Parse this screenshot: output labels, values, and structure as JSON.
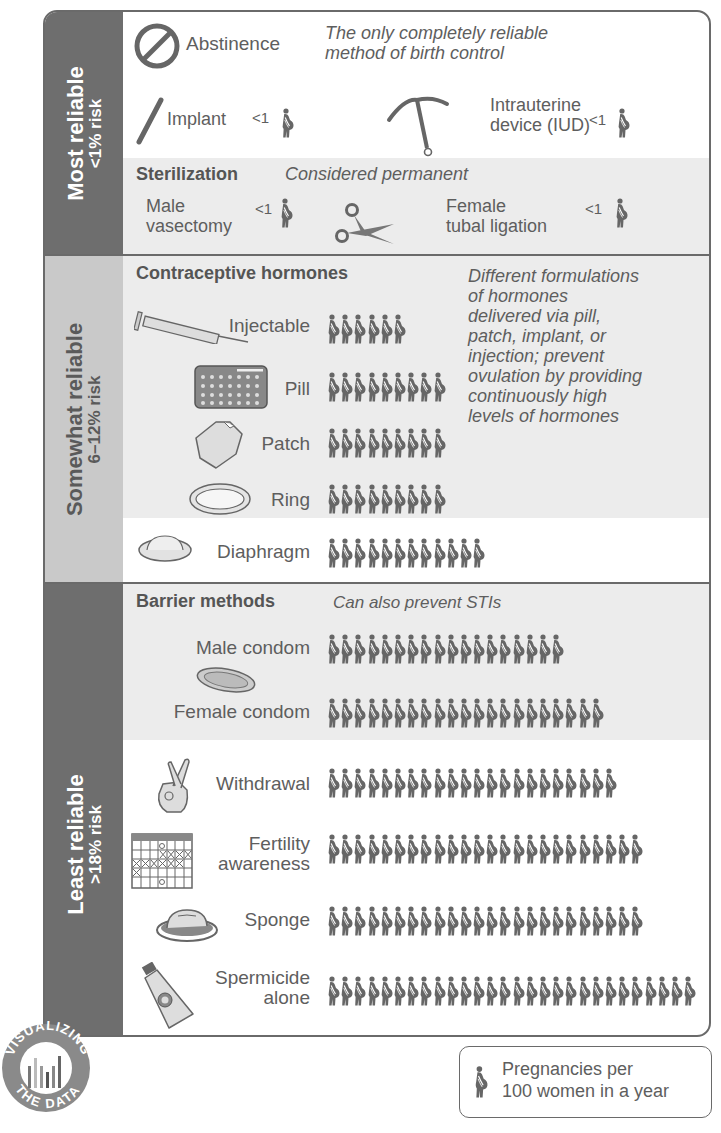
{
  "unit_legend": "Pregnancies per 100 women in a year",
  "legend": {
    "line1": "Pregnancies per",
    "line2": "100 women in a year",
    "icon": "pregnant-woman-icon"
  },
  "badge": {
    "top": "VISUALIZING",
    "bottom": "THE DATA"
  },
  "colors": {
    "band_dark": "#6e6e6e",
    "band_light": "#c9c9c9",
    "shade": "#ececec",
    "icon": "#666666",
    "text": "#5e5e5e"
  },
  "sections": {
    "most": {
      "label": "Most reliable",
      "risk": "<1% risk",
      "abstinence": {
        "label": "Abstinence",
        "note_line1": "The only completely reliable",
        "note_line2": "method of birth control"
      },
      "implant": {
        "label": "Implant",
        "value": "<1"
      },
      "iud": {
        "line1": "Intrauterine",
        "line2": "device (IUD)",
        "value": "<1"
      },
      "sterilization": {
        "heading": "Sterilization",
        "note": "Considered permanent",
        "male_line1": "Male",
        "male_line2": "vasectomy",
        "male_value": "<1",
        "female_line1": "Female",
        "female_line2": "tubal ligation",
        "female_value": "<1"
      }
    },
    "somewhat": {
      "label": "Somewhat reliable",
      "risk": "6–12% risk",
      "hormones_heading": "Contraceptive hormones",
      "hormones_note": [
        "Different formulations",
        "of hormones",
        "delivered via pill,",
        "patch, implant, or",
        "injection; prevent",
        "ovulation by providing",
        "continuously high",
        "levels of hormones"
      ],
      "injectable": "Injectable",
      "pill": "Pill",
      "patch": "Patch",
      "ring": "Ring",
      "diaphragm": "Diaphragm"
    },
    "least": {
      "label": "Least reliable",
      "risk": ">18% risk",
      "barrier_heading": "Barrier methods",
      "barrier_note": "Can also prevent STIs",
      "male_condom": "Male condom",
      "female_condom": "Female condom",
      "withdrawal": "Withdrawal",
      "fertility_line1": "Fertility",
      "fertility_line2": "awareness",
      "sponge": "Sponge",
      "spermicide_line1": "Spermicide",
      "spermicide_line2": "alone"
    }
  },
  "chart_data": {
    "type": "bar",
    "xlabel": "",
    "ylabel": "Pregnancies per 100 women in a year",
    "categories": [
      "Abstinence",
      "Implant",
      "Intrauterine device (IUD)",
      "Male vasectomy",
      "Female tubal ligation",
      "Injectable",
      "Pill",
      "Patch",
      "Ring",
      "Diaphragm",
      "Male condom",
      "Female condom",
      "Withdrawal",
      "Fertility awareness",
      "Sponge",
      "Spermicide alone"
    ],
    "values": [
      0,
      0.5,
      0.5,
      0.5,
      0.5,
      6,
      9,
      9,
      9,
      12,
      18,
      21,
      22,
      24,
      24,
      28
    ],
    "value_labels": [
      "",
      "<1",
      "<1",
      "<1",
      "<1",
      "6",
      "9",
      "9",
      "9",
      "12",
      "18",
      "21",
      "22",
      "24",
      "24",
      "28"
    ],
    "groups": [
      {
        "name": "Most reliable",
        "risk": "<1% risk",
        "members": [
          "Abstinence",
          "Implant",
          "Intrauterine device (IUD)",
          "Male vasectomy",
          "Female tubal ligation"
        ]
      },
      {
        "name": "Somewhat reliable",
        "risk": "6–12% risk",
        "members": [
          "Injectable",
          "Pill",
          "Patch",
          "Ring",
          "Diaphragm"
        ]
      },
      {
        "name": "Least reliable",
        "risk": ">18% risk",
        "members": [
          "Male condom",
          "Female condom",
          "Withdrawal",
          "Fertility awareness",
          "Sponge",
          "Spermicide alone"
        ]
      }
    ],
    "legend": "1 icon = 1 pregnancy per 100 women in a year",
    "grid": false
  },
  "rows": {
    "injectable": 6,
    "pill": 9,
    "patch": 9,
    "ring": 9,
    "diaphragm": 12,
    "male_condom": 18,
    "female_condom": 21,
    "withdrawal": 22,
    "fertility": 24,
    "sponge": 24,
    "spermicide": 28
  }
}
